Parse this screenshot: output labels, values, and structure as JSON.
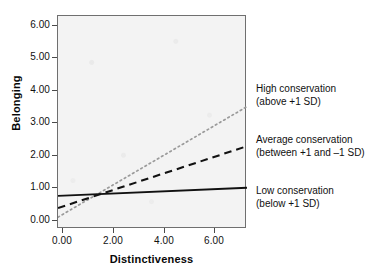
{
  "chart_data": {
    "type": "line",
    "title": "",
    "xlabel": "Distinctiveness",
    "ylabel": "Belonging",
    "xlim": [
      -0.5,
      7.3
    ],
    "ylim": [
      0.0,
      6.3
    ],
    "xticks": [
      "0.00",
      "2.00",
      "4.00",
      "6.00"
    ],
    "xtick_values": [
      0,
      2,
      4,
      6
    ],
    "yticks": [
      "0.00",
      "1.00",
      "2.00",
      "3.00",
      "4.00",
      "5.00",
      "6.00"
    ],
    "ytick_values": [
      0,
      1,
      2,
      3,
      4,
      5,
      6
    ],
    "grid": false,
    "legend_position": "right",
    "series": [
      {
        "name": "High conservation",
        "note": "(above +1 SD)",
        "style": "dotted",
        "color": "#9a9a9a",
        "x": [
          -0.5,
          7.3
        ],
        "y": [
          0.35,
          3.62
        ]
      },
      {
        "name": "Average conservation",
        "note": "(between +1 and –1 SD)",
        "style": "dashed",
        "color": "#111111",
        "x": [
          -0.5,
          7.3
        ],
        "y": [
          0.62,
          2.45
        ]
      },
      {
        "name": "Low conservation",
        "note": "(below +1 SD)",
        "style": "solid",
        "color": "#111111",
        "x": [
          -0.5,
          7.3
        ],
        "y": [
          0.98,
          1.22
        ]
      }
    ]
  },
  "axes": {
    "x_label": "Distinctiveness",
    "y_label": "Belonging",
    "x_ticks": [
      "0.00",
      "2.00",
      "4.00",
      "6.00"
    ],
    "y_ticks": [
      "6.00",
      "5.00",
      "4.00",
      "3.00",
      "2.00",
      "1.00",
      "0.00"
    ]
  },
  "legend": {
    "high": {
      "line1": "High conservation",
      "line2": "(above +1 SD)"
    },
    "average": {
      "line1": "Average conservation",
      "line2": "(between +1 and –1 SD)"
    },
    "low": {
      "line1": "Low conservation",
      "line2": "(below +1 SD)"
    }
  },
  "colors": {
    "panel": "#f3f3f3",
    "frame": "#6f6f6f",
    "solid_line": "#111111",
    "dashed_line": "#111111",
    "dotted_line": "#9a9a9a",
    "text": "#101010"
  }
}
